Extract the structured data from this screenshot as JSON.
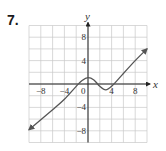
{
  "problem_number": "7.",
  "chart_data": {
    "type": "line",
    "title": "",
    "xlabel": "x",
    "ylabel": "y",
    "xlim": [
      -10,
      10
    ],
    "ylim": [
      -10,
      10
    ],
    "grid": true,
    "grid_step": 2,
    "x_ticks": [
      {
        "value": -8,
        "label": "−8"
      },
      {
        "value": -4,
        "label": "−4"
      },
      {
        "value": 0,
        "label": "0"
      },
      {
        "value": 4,
        "label": "4"
      },
      {
        "value": 8,
        "label": "8"
      }
    ],
    "y_ticks": [
      {
        "value": 8,
        "label": "8"
      },
      {
        "value": 4,
        "label": "4"
      },
      {
        "value": -4,
        "label": "−4"
      },
      {
        "value": -8,
        "label": "−8"
      }
    ],
    "arrows_at_ends": true,
    "series": [
      {
        "name": "f(x)",
        "x": [
          -10,
          -6,
          -4,
          -2,
          -1,
          0,
          1,
          2,
          3,
          4,
          6,
          8,
          10
        ],
        "y": [
          -7.8,
          -4.4,
          -2.6,
          -0.4,
          0.6,
          1.1,
          0.7,
          -0.4,
          -1.0,
          -0.4,
          1.8,
          4,
          6
        ]
      }
    ],
    "colors": {
      "grid": "#c8c8c8",
      "axes": "#222222",
      "curve": "#555555"
    }
  }
}
